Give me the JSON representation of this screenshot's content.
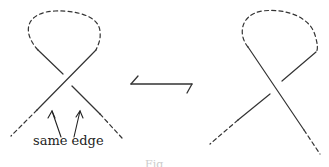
{
  "figure": {
    "annotation_label": "same edge",
    "caption_partial": "Fig",
    "colors": {
      "stroke": "#333333",
      "background": "#ffffff",
      "caption": "#cccccc"
    },
    "left_diagram": {
      "description": "Kink loop crossing; strand from upper-right to lower-left passes over",
      "over_strand": "upper-right to lower-left",
      "loop_style": "dashed",
      "tails_style": "dashed",
      "annotation_arrows": 2
    },
    "right_diagram": {
      "description": "Kink loop crossing; strand from upper-left to lower-right passes over",
      "over_strand": "upper-left to lower-right",
      "loop_style": "dashed",
      "tails_style": "dashed"
    },
    "transition_arrow": {
      "style": "harpoon",
      "direction": "bidirectional"
    }
  }
}
